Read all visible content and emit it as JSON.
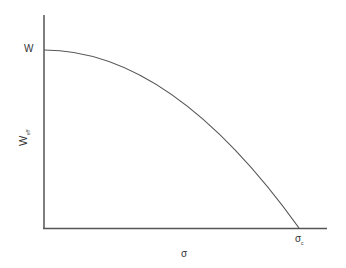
{
  "diagram": {
    "y_axis_label": "W",
    "y_axis_label_sub": "eff",
    "x_axis_label": "σ",
    "y_intercept_label": "W",
    "x_intercept_label": "σ",
    "x_intercept_label_sub": "c",
    "curve_description": "Effective W decreases parabolically from W at σ=0 to zero at σ=σc",
    "colors": {
      "axis": "#555555",
      "curve": "#555555",
      "text": "#333333",
      "background": "#ffffff"
    }
  }
}
